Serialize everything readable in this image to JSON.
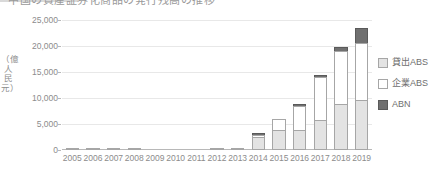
{
  "title_sliver": {
    "text": "中国の資産証券化商品の発行残高の推移"
  },
  "chart_data": {
    "type": "bar",
    "stacked": true,
    "title": "",
    "xlabel": "",
    "ylabel": "（億人民元）",
    "ylim": [
      0,
      25000
    ],
    "yticks": [
      0,
      5000,
      10000,
      15000,
      20000,
      25000
    ],
    "ytick_labels": [
      "0",
      "5,000",
      "10,000",
      "15,000",
      "20,000",
      "25,000"
    ],
    "grid": true,
    "legend_position": "right",
    "categories": [
      "2005",
      "2006",
      "2007",
      "2008",
      "2009",
      "2010",
      "2011",
      "2012",
      "2013",
      "2014",
      "2015",
      "2016",
      "2017",
      "2018",
      "2019"
    ],
    "series": [
      {
        "name": "貸出ABS",
        "color": "#e3e3e3",
        "values": [
          170,
          330,
          290,
          300,
          0,
          0,
          0,
          190,
          280,
          2500,
          3800,
          3800,
          5800,
          8900,
          9600
        ]
      },
      {
        "name": "企業ABS",
        "color": "#ffffff",
        "values": [
          0,
          0,
          0,
          0,
          0,
          0,
          0,
          0,
          0,
          400,
          2100,
          4700,
          8300,
          10100,
          10900
        ]
      },
      {
        "name": "ABN",
        "color": "#707070",
        "values": [
          0,
          0,
          0,
          0,
          0,
          0,
          0,
          0,
          0,
          100,
          0,
          100,
          400,
          800,
          2900
        ]
      }
    ],
    "totals": [
      170,
      330,
      290,
      300,
      0,
      0,
      0,
      190,
      280,
      3000,
      5900,
      8600,
      14500,
      19800,
      23400
    ]
  },
  "legend": {
    "items": [
      {
        "label": "貸出ABS",
        "swatch": "light-gray-square"
      },
      {
        "label": "企業ABS",
        "swatch": "white-square"
      },
      {
        "label": "ABN",
        "swatch": "dark-gray-square"
      }
    ]
  },
  "colors": {
    "loan_abs": "#e3e3e3",
    "corp_abs": "#ffffff",
    "abn": "#707070",
    "gridline": "#e8e8e8",
    "axis": "#b8b8b8",
    "text": "#8c8c8c"
  }
}
